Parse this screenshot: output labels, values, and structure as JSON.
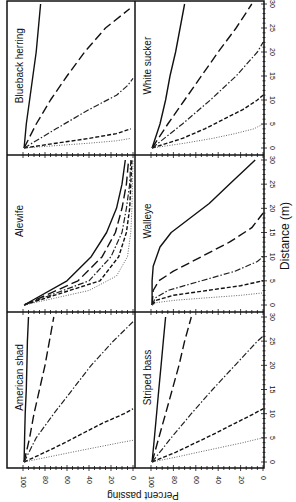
{
  "chart_data": {
    "type": "line",
    "layout": "2 rows x 3 columns of small multiples; figure displayed rotated 90 degrees",
    "xlabel": "Distance (m)",
    "ylabel": "Percent passing",
    "xlim": [
      0,
      30
    ],
    "ylim": [
      0,
      100
    ],
    "x_ticks": [
      0,
      5,
      10,
      15,
      20,
      25,
      30
    ],
    "y_ticks": [
      0,
      20,
      40,
      60,
      80,
      100
    ],
    "grid": false,
    "legend": "none",
    "series_styles": [
      "solid",
      "long-dash",
      "dash-dot",
      "short-dash",
      "dotted"
    ],
    "panels": [
      {
        "title": "Blueback herring",
        "series": [
          {
            "style": "solid",
            "x": [
              0,
              5,
              10,
              15,
              20,
              25,
              30
            ],
            "y": [
              99,
              97,
              94,
              91,
              88,
              86,
              84
            ]
          },
          {
            "style": "long-dash",
            "x": [
              0,
              5,
              10,
              15,
              20,
              25,
              29
            ],
            "y": [
              99,
              88,
              75,
              60,
              44,
              25,
              3
            ]
          },
          {
            "style": "dash-dot",
            "x": [
              0,
              4,
              8,
              11,
              13,
              14.5
            ],
            "y": [
              99,
              70,
              40,
              15,
              5,
              0
            ]
          },
          {
            "style": "short-dash",
            "x": [
              0,
              1,
              2,
              3,
              4
            ],
            "y": [
              99,
              70,
              40,
              15,
              2
            ]
          },
          {
            "style": "dotted",
            "x": [
              0,
              0.5,
              1,
              1.5,
              2
            ],
            "y": [
              99,
              70,
              40,
              15,
              2
            ]
          }
        ]
      },
      {
        "title": "Alewife",
        "series": [
          {
            "style": "solid",
            "x": [
              0,
              5,
              10,
              15,
              20,
              25,
              30
            ],
            "y": [
              99,
              60,
              38,
              24,
              15,
              10,
              7
            ]
          },
          {
            "style": "long-dash",
            "x": [
              0,
              5,
              10,
              15,
              20,
              25,
              30
            ],
            "y": [
              99,
              50,
              28,
              16,
              10,
              6,
              4
            ]
          },
          {
            "style": "dash-dot",
            "x": [
              0,
              5,
              10,
              15,
              20,
              25,
              30
            ],
            "y": [
              99,
              40,
              20,
              10,
              6,
              3,
              2
            ]
          },
          {
            "style": "short-dash",
            "x": [
              0,
              5,
              10,
              15,
              20,
              25,
              30
            ],
            "y": [
              99,
              30,
              13,
              6,
              3,
              2,
              1
            ]
          },
          {
            "style": "dotted",
            "x": [
              0,
              3,
              6,
              10,
              15,
              20,
              30
            ],
            "y": [
              99,
              40,
              15,
              5,
              2,
              1,
              0
            ]
          }
        ]
      },
      {
        "title": "American shad",
        "series": [
          {
            "style": "solid",
            "x": [
              0,
              5,
              10,
              15,
              20,
              25,
              30
            ],
            "y": [
              99,
              98.5,
              98,
              97,
              96.5,
              96,
              95
            ]
          },
          {
            "style": "long-dash",
            "x": [
              0,
              5,
              10,
              15,
              20,
              25,
              30
            ],
            "y": [
              99,
              94,
              90,
              85,
              80,
              76,
              72
            ]
          },
          {
            "style": "dash-dot",
            "x": [
              0,
              5,
              10,
              15,
              20,
              25,
              29
            ],
            "y": [
              99,
              88,
              72,
              55,
              38,
              18,
              0
            ]
          },
          {
            "style": "short-dash",
            "x": [
              0,
              2,
              4,
              6,
              8,
              10,
              11
            ],
            "y": [
              99,
              80,
              62,
              45,
              28,
              8,
              0
            ]
          },
          {
            "style": "dotted",
            "x": [
              0,
              1,
              2,
              3,
              4,
              4.5
            ],
            "y": [
              99,
              78,
              56,
              34,
              12,
              0
            ]
          }
        ]
      },
      {
        "title": "White sucker",
        "series": [
          {
            "style": "solid",
            "x": [
              0,
              5,
              10,
              15,
              20,
              25,
              30
            ],
            "y": [
              99,
              92,
              87,
              83,
              78,
              74,
              70
            ]
          },
          {
            "style": "long-dash",
            "x": [
              0,
              5,
              10,
              15,
              20,
              25,
              30
            ],
            "y": [
              99,
              85,
              70,
              55,
              40,
              24,
              10
            ]
          },
          {
            "style": "dash-dot",
            "x": [
              0,
              5,
              10,
              15,
              20,
              22
            ],
            "y": [
              99,
              72,
              47,
              24,
              5,
              0
            ]
          },
          {
            "style": "short-dash",
            "x": [
              0,
              2,
              4,
              6,
              8,
              10,
              11
            ],
            "y": [
              99,
              72,
              52,
              35,
              18,
              5,
              0
            ]
          },
          {
            "style": "dotted",
            "x": [
              0,
              1,
              2,
              3,
              4,
              5
            ],
            "y": [
              99,
              70,
              45,
              25,
              8,
              0
            ]
          }
        ]
      },
      {
        "title": "Walleye",
        "series": [
          {
            "style": "solid",
            "x": [
              0,
              5,
              8,
              12,
              15,
              18,
              21,
              25,
              30
            ],
            "y": [
              99,
              99,
              98,
              92,
              82,
              65,
              48,
              30,
              7
            ]
          },
          {
            "style": "long-dash",
            "x": [
              0,
              3,
              5,
              7,
              10,
              13,
              16,
              19
            ],
            "y": [
              99,
              98,
              93,
              80,
              55,
              30,
              10,
              0
            ]
          },
          {
            "style": "dash-dot",
            "x": [
              0,
              1.5,
              3,
              5,
              7,
              9,
              10
            ],
            "y": [
              99,
              96,
              85,
              55,
              25,
              5,
              0
            ]
          },
          {
            "style": "short-dash",
            "x": [
              0,
              1,
              2,
              3,
              4,
              5
            ],
            "y": [
              99,
              95,
              80,
              50,
              20,
              0
            ]
          },
          {
            "style": "dotted",
            "x": [
              0,
              0.5,
              1,
              1.5,
              2,
              2.5
            ],
            "y": [
              99,
              95,
              78,
              50,
              20,
              0
            ]
          }
        ]
      },
      {
        "title": "Striped bass",
        "series": [
          {
            "style": "solid",
            "x": [
              0,
              5,
              10,
              15,
              20,
              25,
              30
            ],
            "y": [
              99,
              97,
              95,
              93,
              91,
              89,
              87
            ]
          },
          {
            "style": "long-dash",
            "x": [
              0,
              5,
              10,
              15,
              20,
              25,
              30
            ],
            "y": [
              99,
              93,
              87,
              81,
              75,
              70,
              64
            ]
          },
          {
            "style": "dash-dot",
            "x": [
              0,
              5,
              10,
              15,
              20,
              25,
              26
            ],
            "y": [
              99,
              82,
              64,
              45,
              25,
              5,
              0
            ]
          },
          {
            "style": "short-dash",
            "x": [
              0,
              2,
              4,
              6,
              8,
              10,
              11
            ],
            "y": [
              99,
              78,
              60,
              42,
              25,
              8,
              0
            ]
          },
          {
            "style": "dotted",
            "x": [
              0,
              1,
              2,
              3,
              4,
              5
            ],
            "y": [
              99,
              78,
              58,
              38,
              18,
              0
            ]
          }
        ]
      }
    ]
  },
  "labels": {
    "xlabel": "Distance (m)",
    "ylabel": "Percent passing",
    "panel_titles": [
      "Blueback herring",
      "Alewife",
      "American shad",
      "White sucker",
      "Walleye",
      "Striped bass"
    ]
  }
}
